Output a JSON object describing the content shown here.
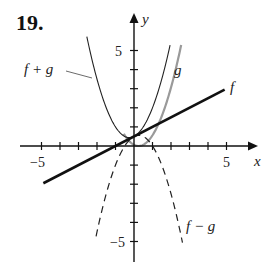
{
  "problem_number": "19.",
  "chart_data": {
    "type": "line",
    "title": "",
    "xlabel": "x",
    "ylabel": "y",
    "xlim": [
      -6,
      6.5
    ],
    "ylim": [
      -5.5,
      6
    ],
    "x_ticks": [
      -5,
      -4,
      -3,
      -2,
      -1,
      1,
      2,
      3,
      4,
      5
    ],
    "y_ticks": [
      -5,
      -4,
      -3,
      -2,
      -1,
      1,
      2,
      3,
      4,
      5
    ],
    "x_tick_labels": [
      "-5",
      "5"
    ],
    "y_tick_labels": [
      "5",
      "-5"
    ],
    "grid": false,
    "series": [
      {
        "name": "f",
        "style": "solid-thick-black",
        "formula": "0.5x + 0.5",
        "x": [
          -4.9,
          4.9
        ],
        "y": [
          -1.95,
          2.95
        ]
      },
      {
        "name": "g",
        "style": "solid-gray",
        "formula": "x^2",
        "x": [
          -0.5,
          0,
          0.5,
          1,
          1.5,
          2,
          2.3
        ],
        "y": [
          0.25,
          0,
          0.25,
          1,
          2.25,
          4,
          5.3
        ]
      },
      {
        "name": "f + g",
        "style": "solid-thin-black",
        "formula": "x^2 + 0.5x + 0.5",
        "x": [
          -2.5,
          -2,
          -1,
          -0.25,
          0,
          1,
          1.9
        ],
        "y": [
          5.5,
          3.5,
          1,
          0.44,
          0.5,
          2,
          5.06
        ]
      },
      {
        "name": "f - g",
        "style": "dashed-black",
        "formula": "-x^2 + 0.5x + 0.5",
        "x": [
          -2,
          -1,
          -0.5,
          0.25,
          1,
          2,
          2.6
        ],
        "y": [
          -4.5,
          -1,
          0,
          0.56,
          0,
          -2.5,
          -5.0
        ]
      }
    ],
    "annotations": [
      {
        "text": "f + g",
        "position": "upper-left, leader line to left branch"
      },
      {
        "text": "g",
        "position": "right of g curve near y=4"
      },
      {
        "text": "f",
        "position": "end of line f near (5,3)"
      },
      {
        "text": "f − g",
        "position": "lower right near dashed curve"
      }
    ]
  },
  "labels": {
    "x_axis": "x",
    "y_axis": "y",
    "x_neg5": "−5",
    "x_pos5": "5",
    "y_pos5": "5",
    "y_neg5": "−5",
    "f": "f",
    "g": "g",
    "f_plus_g": "f + g",
    "f_minus_g": "f − g"
  }
}
